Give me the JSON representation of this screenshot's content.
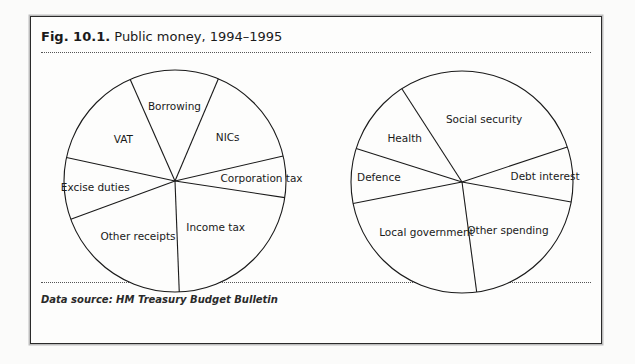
{
  "figure": {
    "label": "Fig. 10.1.",
    "title": "Public money, 1994–1995",
    "source": "Data source: HM Treasury Budget Bulletin"
  },
  "chart_data": [
    {
      "type": "pie",
      "title": "Receipts",
      "start": "Borrowing begins near 12 o'clock, slices run clockwise",
      "unit": "percent (estimated from slice angles)",
      "categories": [
        "Borrowing",
        "NICs",
        "Corporation tax",
        "Income tax",
        "Other receipts",
        "Excise duties",
        "VAT"
      ],
      "values": [
        13,
        15,
        6,
        22,
        20,
        9,
        15
      ],
      "start_angle_deg": -23.8
    },
    {
      "type": "pie",
      "title": "Spending",
      "start": "Social security begins near 12 o'clock, slices run clockwise",
      "unit": "percent (estimated from slice angles)",
      "categories": [
        "Social security",
        "Debt interest",
        "Other spending",
        "Local government",
        "Defence",
        "Health"
      ],
      "values": [
        29,
        8,
        20,
        24,
        8,
        11
      ],
      "start_angle_deg": -32.8
    }
  ],
  "colors": {
    "line": "#1a1a1a",
    "fill": "#fdfdfc"
  }
}
